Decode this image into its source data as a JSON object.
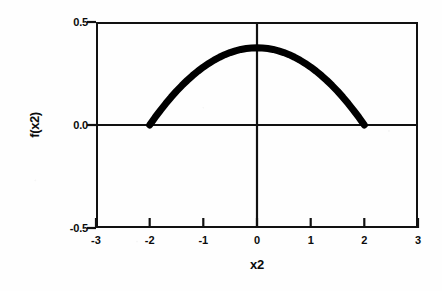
{
  "chart_data": {
    "type": "line",
    "title": "",
    "xlabel": "x2",
    "ylabel": "f(x2)",
    "xlim": [
      -3,
      3
    ],
    "ylim": [
      -0.5,
      0.5
    ],
    "xticks": [
      "-3",
      "-2",
      "-1",
      "0",
      "1",
      "2",
      "3"
    ],
    "xtick_values": [
      -3,
      -2,
      -1,
      0,
      1,
      2,
      3
    ],
    "yticks": [
      "-0.5",
      "0.0",
      "0.5"
    ],
    "ytick_values": [
      -0.5,
      0.0,
      0.5
    ],
    "grid": false,
    "legend": null,
    "series": [
      {
        "name": "f(x2)",
        "description": "Epanechnikov-type kernel density, support [-2, 2], peak 0.375 at x = 0",
        "line_color": "#000000",
        "line_width_px": 7,
        "x": [
          -2.0,
          -1.9,
          -1.8,
          -1.7,
          -1.6,
          -1.5,
          -1.4,
          -1.3,
          -1.2,
          -1.1,
          -1.0,
          -0.9,
          -0.8,
          -0.7,
          -0.6,
          -0.5,
          -0.4,
          -0.3,
          -0.2,
          -0.1,
          0.0,
          0.1,
          0.2,
          0.3,
          0.4,
          0.5,
          0.6,
          0.7,
          0.8,
          0.9,
          1.0,
          1.1,
          1.2,
          1.3,
          1.4,
          1.5,
          1.6,
          1.7,
          1.8,
          1.9,
          2.0
        ],
        "values": [
          0.0,
          0.0366,
          0.0713,
          0.1041,
          0.135,
          0.1641,
          0.1913,
          0.2166,
          0.24,
          0.2616,
          0.2813,
          0.299,
          0.315,
          0.329,
          0.3413,
          0.3516,
          0.36,
          0.3666,
          0.3713,
          0.3741,
          0.375,
          0.3741,
          0.3713,
          0.3666,
          0.36,
          0.3516,
          0.3413,
          0.329,
          0.315,
          0.299,
          0.2813,
          0.2616,
          0.24,
          0.2166,
          0.1913,
          0.1641,
          0.135,
          0.1041,
          0.0713,
          0.0366,
          0.0
        ]
      }
    ],
    "reference_lines": [
      {
        "name": "zero-horizontal",
        "axis": "y",
        "value": 0.0
      },
      {
        "name": "zero-vertical",
        "axis": "x",
        "value": 0.0
      }
    ],
    "colors": {
      "curve": "#000000",
      "axis": "#111111",
      "text": "#0b0b0b",
      "background": "#fefefe"
    }
  }
}
